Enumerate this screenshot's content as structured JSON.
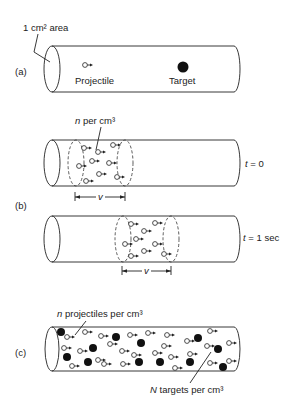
{
  "panel_a": {
    "label": "(a)",
    "area_label": "1 cm² area",
    "projectile_label": "Projectile",
    "target_label": "Target"
  },
  "panel_b": {
    "label": "(b)",
    "density_label_var": "n",
    "density_label_text": " per cm³",
    "t0_var": "t",
    "t0_value": " = 0",
    "t1_var": "t",
    "t1_value": " = 1 sec",
    "distance_label": "v"
  },
  "panel_c": {
    "label": "(c)",
    "projectiles_var": "n",
    "projectiles_text": " projectiles per cm³",
    "targets_var": "N",
    "targets_text": " targets per cm³"
  },
  "colors": {
    "ink": "#222222",
    "background": "#ffffff"
  }
}
